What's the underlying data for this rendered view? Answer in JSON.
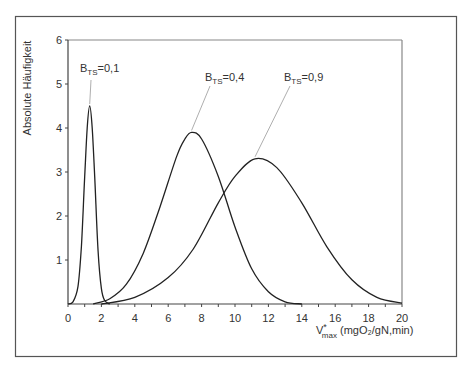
{
  "chart_data": {
    "type": "line",
    "title": "",
    "xlabel": "V*max (mgO2/gN,min)",
    "xlabel_parts": {
      "main": "V",
      "sup": "*",
      "sub": "max",
      "rest": " (mgO₂/gN,min)"
    },
    "ylabel": "Absolute Häufigkeit",
    "xlim": [
      0,
      20
    ],
    "ylim": [
      0,
      6
    ],
    "xticks": [
      0,
      2,
      4,
      6,
      8,
      10,
      12,
      14,
      16,
      18,
      20
    ],
    "yticks": [
      1,
      2,
      3,
      4,
      5,
      6
    ],
    "grid": false,
    "legend": "annotations",
    "series": [
      {
        "name": "B_TS=0,1",
        "label_main": "B",
        "label_sub": "TS",
        "label_value": "=0,1",
        "peak_x": 1.3,
        "peak_y": 4.5,
        "x": [
          0.0,
          0.3,
          0.6,
          0.8,
          1.0,
          1.15,
          1.3,
          1.45,
          1.6,
          1.8,
          2.0,
          2.2,
          2.5
        ],
        "y": [
          0.0,
          0.05,
          0.4,
          1.3,
          2.9,
          4.0,
          4.5,
          4.0,
          2.9,
          1.2,
          0.35,
          0.08,
          0.0
        ]
      },
      {
        "name": "B_TS=0,4",
        "label_main": "B",
        "label_sub": "TS",
        "label_value": "=0,4",
        "peak_x": 7.4,
        "peak_y": 3.9,
        "x": [
          1.5,
          2.5,
          3.5,
          4.5,
          5.5,
          6.5,
          7.0,
          7.4,
          8.0,
          9.0,
          10.0,
          11.0,
          12.0,
          13.0,
          14.0
        ],
        "y": [
          0.0,
          0.12,
          0.45,
          1.15,
          2.2,
          3.35,
          3.75,
          3.9,
          3.75,
          2.9,
          1.75,
          0.8,
          0.28,
          0.05,
          0.0
        ]
      },
      {
        "name": "B_TS=0,9",
        "label_main": "B",
        "label_sub": "TS",
        "label_value": "=0,9",
        "peak_x": 11.2,
        "peak_y": 3.3,
        "x": [
          2.0,
          4.0,
          6.0,
          7.5,
          9.0,
          10.0,
          11.2,
          12.5,
          14.0,
          15.5,
          17.0,
          18.5,
          20.0
        ],
        "y": [
          0.0,
          0.15,
          0.6,
          1.25,
          2.3,
          2.9,
          3.3,
          3.1,
          2.3,
          1.3,
          0.55,
          0.15,
          0.02
        ]
      }
    ]
  },
  "labels": {
    "yaxis": "Absolute Häufigkeit"
  }
}
